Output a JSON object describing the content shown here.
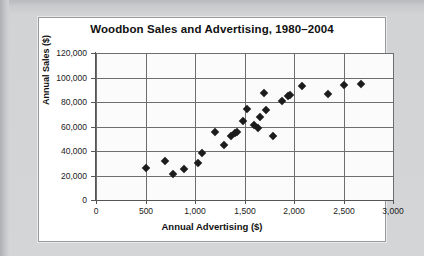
{
  "chart_data": {
    "type": "scatter",
    "title": "Woodbon Sales and Advertising, 1980–2004",
    "xlabel": "Annual Advertising ($)",
    "ylabel": "Annual Sales ($)",
    "xlim": [
      0,
      3000
    ],
    "ylim": [
      0,
      120000
    ],
    "xticks": [
      0,
      500,
      1000,
      1500,
      2000,
      2500,
      3000
    ],
    "xtick_labels": [
      "0",
      "500",
      "1,000",
      "1,500",
      "2,000",
      "2,500",
      "3,000"
    ],
    "yticks": [
      0,
      20000,
      40000,
      60000,
      80000,
      100000,
      120000
    ],
    "ytick_labels": [
      "0",
      "20,000",
      "40,000",
      "60,000",
      "80,000",
      "100,000",
      "120,000"
    ],
    "grid": true,
    "legend": false,
    "marker": "diamond",
    "marker_color": "#1c1c1c",
    "points": [
      {
        "x": 500,
        "y": 26000
      },
      {
        "x": 700,
        "y": 32000
      },
      {
        "x": 780,
        "y": 21500
      },
      {
        "x": 890,
        "y": 25000
      },
      {
        "x": 1030,
        "y": 30000
      },
      {
        "x": 1070,
        "y": 38500
      },
      {
        "x": 1200,
        "y": 55500
      },
      {
        "x": 1290,
        "y": 45000
      },
      {
        "x": 1360,
        "y": 52500
      },
      {
        "x": 1400,
        "y": 55000
      },
      {
        "x": 1420,
        "y": 55500
      },
      {
        "x": 1480,
        "y": 64500
      },
      {
        "x": 1530,
        "y": 74500
      },
      {
        "x": 1600,
        "y": 61500
      },
      {
        "x": 1640,
        "y": 58500
      },
      {
        "x": 1660,
        "y": 67500
      },
      {
        "x": 1700,
        "y": 87500
      },
      {
        "x": 1720,
        "y": 73500
      },
      {
        "x": 1790,
        "y": 52500
      },
      {
        "x": 1880,
        "y": 80500
      },
      {
        "x": 1940,
        "y": 85000
      },
      {
        "x": 1960,
        "y": 85500
      },
      {
        "x": 2080,
        "y": 93000
      },
      {
        "x": 2340,
        "y": 86500
      },
      {
        "x": 2500,
        "y": 93500
      },
      {
        "x": 2680,
        "y": 94500
      }
    ]
  },
  "axes": {
    "y_title": "Annual Sales ($)",
    "x_title": "Annual Advertising ($)"
  }
}
